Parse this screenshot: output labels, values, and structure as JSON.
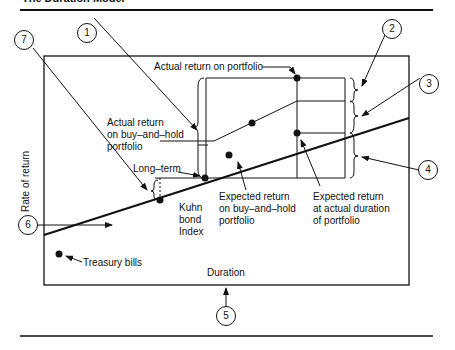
{
  "title": "The Duration Model",
  "axes": {
    "x_label": "Duration",
    "y_label": "Rate of return"
  },
  "labels": {
    "actual_return_portfolio": "Actual return on portfolio",
    "actual_bh_1": "Actual return",
    "actual_bh_2": "on buy–and–hold",
    "actual_bh_3": "portfolio",
    "long_term": "Long–term",
    "kuhn_1": "Kuhn",
    "kuhn_2": "bond",
    "kuhn_3": "Index",
    "expected_bh_1": "Expected return",
    "expected_bh_2": "on buy–and–hold",
    "expected_bh_3": "portfolio",
    "expected_dur_1": "Expected return",
    "expected_dur_2": "at actual duration",
    "expected_dur_3": "of portfolio",
    "treasury": "Treasury bills"
  },
  "callouts": [
    "1",
    "2",
    "3",
    "4",
    "5",
    "6",
    "7"
  ],
  "colors": {
    "ink": "#111111",
    "background": "#ffffff"
  }
}
